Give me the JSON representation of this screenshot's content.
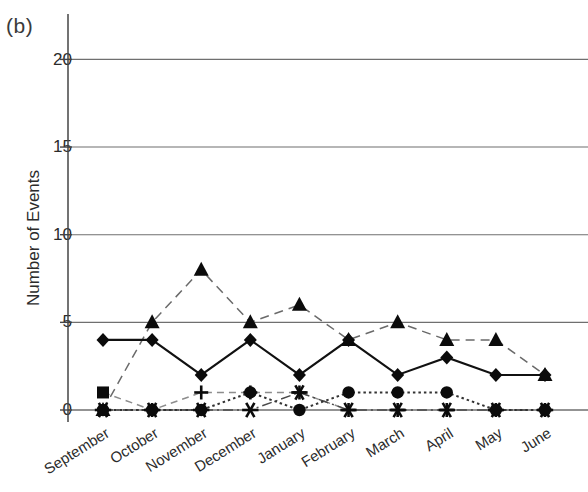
{
  "figure": {
    "panel_label": "(b)",
    "ylabel": "Number of Events"
  },
  "axis": {
    "y_ticks": [
      "0",
      "5",
      "10",
      "15",
      "20"
    ],
    "x_ticks": [
      "September",
      "October",
      "November",
      "December",
      "January",
      "February",
      "March",
      "April",
      "May",
      "June"
    ]
  },
  "colors": {
    "line": "#111111",
    "dashed": "#555555",
    "grid": "#6f6f6f",
    "axis": "#444444",
    "text": "#2b2b2b"
  },
  "chart_data": {
    "type": "line",
    "title": "(b)",
    "xlabel": "",
    "ylabel": "Number of Events",
    "ylim": [
      0,
      21
    ],
    "yticks": [
      0,
      5,
      10,
      15,
      20
    ],
    "grid": "horizontal",
    "legend": "none",
    "categories": [
      "September",
      "October",
      "November",
      "December",
      "January",
      "February",
      "March",
      "April",
      "May",
      "June"
    ],
    "series": [
      {
        "name": "Series 1",
        "marker": "diamond",
        "linestyle": "solid",
        "values": [
          4,
          4,
          2,
          4,
          2,
          4,
          2,
          3,
          2,
          2
        ]
      },
      {
        "name": "Series 2",
        "marker": "triangle",
        "linestyle": "dashed",
        "values": [
          0,
          5,
          8,
          5,
          6,
          4,
          5,
          4,
          4,
          2
        ]
      },
      {
        "name": "Series 3",
        "marker": "circle",
        "linestyle": "dotted",
        "values": [
          0,
          0,
          0,
          1,
          0,
          1,
          1,
          1,
          0,
          0
        ]
      },
      {
        "name": "Series 4",
        "marker": "star",
        "linestyle": "dashdot",
        "values": [
          0,
          0,
          0,
          0,
          1,
          0,
          0,
          0,
          0,
          0
        ]
      },
      {
        "name": "Series 5",
        "marker": "square-plus",
        "linestyle": "dashed-light",
        "values": [
          1,
          0,
          1,
          1,
          1,
          0,
          0,
          0,
          0,
          0
        ]
      }
    ]
  }
}
